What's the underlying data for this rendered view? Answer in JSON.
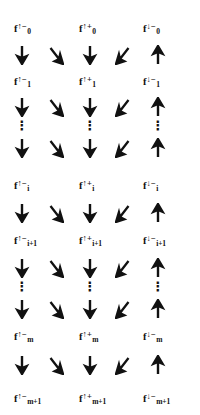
{
  "figure": {
    "ink_color": "#111111",
    "background_color": "#ffffff",
    "label_columns": [
      "up-minus",
      "up-plus",
      "down-minus"
    ],
    "arrow_columns": [
      "down",
      "down-right",
      "down",
      "down-left",
      "up"
    ]
  },
  "label_rows": [
    {
      "index": "0",
      "cells": [
        {
          "base": "f",
          "spin": "↑",
          "sign": "−",
          "idx": "0"
        },
        {
          "base": "f",
          "spin": "↑",
          "sign": "+",
          "idx": "0"
        },
        {
          "base": "f",
          "spin": "↓",
          "sign": "−",
          "idx": "0"
        }
      ]
    },
    {
      "index": "1",
      "cells": [
        {
          "base": "f",
          "spin": "↑",
          "sign": "−",
          "idx": "1"
        },
        {
          "base": "f",
          "spin": "↑",
          "sign": "+",
          "idx": "1"
        },
        {
          "base": "f",
          "spin": "↓",
          "sign": "−",
          "idx": "1"
        }
      ]
    },
    {
      "index": "i",
      "cells": [
        {
          "base": "f",
          "spin": "↑",
          "sign": "−",
          "idx": "i"
        },
        {
          "base": "f",
          "spin": "↑",
          "sign": "+",
          "idx": "i"
        },
        {
          "base": "f",
          "spin": "↓",
          "sign": "−",
          "idx": "i"
        }
      ]
    },
    {
      "index": "i+1",
      "cells": [
        {
          "base": "f",
          "spin": "↑",
          "sign": "−",
          "idx": "i+1"
        },
        {
          "base": "f",
          "spin": "↑",
          "sign": "+",
          "idx": "i+1"
        },
        {
          "base": "f",
          "spin": "↓",
          "sign": "−",
          "idx": "i+1"
        }
      ]
    },
    {
      "index": "m",
      "cells": [
        {
          "base": "f",
          "spin": "↑",
          "sign": "−",
          "idx": "m"
        },
        {
          "base": "f",
          "spin": "↑",
          "sign": "+",
          "idx": "m"
        },
        {
          "base": "f",
          "spin": "↓",
          "sign": "−",
          "idx": "m"
        }
      ]
    },
    {
      "index": "m+1",
      "cells": [
        {
          "base": "f",
          "spin": "↑",
          "sign": "−",
          "idx": "m+1"
        },
        {
          "base": "f",
          "spin": "↑",
          "sign": "+",
          "idx": "m+1"
        },
        {
          "base": "f",
          "spin": "↓",
          "sign": "−",
          "idx": "m+1"
        }
      ]
    }
  ],
  "arrow_glyphs": {
    "down": "↓",
    "down_right": "↘",
    "down_left": "↙",
    "up": "↑",
    "vertical_dots": "⋮"
  }
}
